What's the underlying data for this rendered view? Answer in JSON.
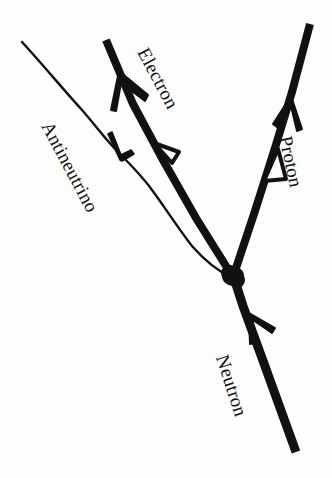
{
  "figure": {
    "background_color": "#fdfdfd",
    "ink_color": "#111111"
  },
  "labels": {
    "electron": "Electron",
    "antineutrino": "Antineutrino",
    "proton": "Proton",
    "neutron": "Neutron"
  },
  "particles": [
    {
      "name": "neutron",
      "label": "Neutron",
      "line_style": "thick-solid",
      "direction": "incoming",
      "arrow_style": "solid-chevron",
      "label_rotation_deg": 72,
      "label_x": 232,
      "label_y": 352,
      "font_size": 19
    },
    {
      "name": "proton",
      "label": "Proton",
      "line_style": "thick-solid",
      "direction": "outgoing",
      "arrow_style": "solid-chevron-plus-hollow-triangle",
      "label_rotation_deg": 78,
      "label_x": 296,
      "label_y": 134,
      "font_size": 19
    },
    {
      "name": "electron",
      "label": "Electron",
      "line_style": "thick-solid",
      "direction": "outgoing",
      "arrow_style": "solid-chevron-plus-hollow-triangle",
      "label_rotation_deg": 62,
      "label_x": 152,
      "label_y": 44,
      "font_size": 19
    },
    {
      "name": "antineutrino",
      "label": "Antineutrino",
      "line_style": "thin-wavy",
      "direction": "outgoing",
      "arrow_style": "thin-chevron",
      "label_rotation_deg": 62,
      "label_x": 56,
      "label_y": 118,
      "font_size": 19
    }
  ],
  "vertex": {
    "name": "interaction-vertex",
    "x": 233,
    "y": 276,
    "radius": 11
  }
}
